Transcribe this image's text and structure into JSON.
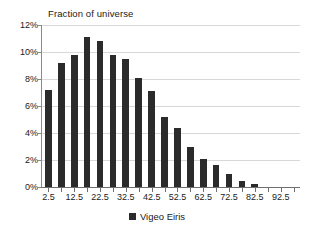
{
  "chart_data": {
    "type": "bar",
    "title": "Fraction of universe",
    "xlabel": "",
    "ylabel": "",
    "ylim": [
      0,
      12
    ],
    "ytick_labels": [
      "12%",
      "10%",
      "8%",
      "6%",
      "4%",
      "2%",
      "0%"
    ],
    "ytick_values": [
      12,
      10,
      8,
      6,
      4,
      2,
      0
    ],
    "grid": true,
    "legend_position": "bottom",
    "legend": [
      "Vigeo Eiris"
    ],
    "series": [
      {
        "name": "Vigeo Eiris",
        "color": "#2b2b2b",
        "values": [
          7.2,
          9.2,
          9.8,
          11.1,
          10.8,
          9.8,
          9.5,
          8.1,
          7.1,
          5.2,
          4.4,
          3.0,
          2.1,
          1.6,
          1.0,
          0.45,
          0.2,
          0.0,
          0.0,
          0.0
        ]
      }
    ],
    "categories": [
      2.5,
      7.5,
      12.5,
      17.5,
      22.5,
      27.5,
      32.5,
      37.5,
      42.5,
      47.5,
      52.5,
      57.5,
      62.5,
      67.5,
      72.5,
      77.5,
      82.5,
      87.5,
      92.5,
      97.5
    ],
    "xtick_labels": [
      "2.5",
      "12.5",
      "22.5",
      "32.5",
      "42.5",
      "52.5",
      "62.5",
      "72.5",
      "82.5",
      "92.5"
    ],
    "xtick_values": [
      2.5,
      12.5,
      22.5,
      32.5,
      42.5,
      52.5,
      62.5,
      72.5,
      82.5,
      92.5
    ]
  },
  "legend": {
    "label": "Vigeo Eiris"
  },
  "colors": {
    "bar": "#2b2b2b",
    "grid": "#d8d8d8",
    "axis": "#6e6e6e",
    "text": "#1a1a1a",
    "background": "#ffffff"
  }
}
